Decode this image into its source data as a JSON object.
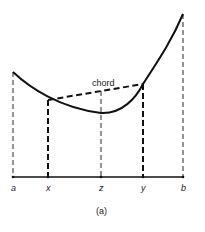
{
  "diagram": {
    "caption": "(a)",
    "chord_label": "chord",
    "axis_labels": {
      "a": "a",
      "x": "x",
      "z": "z",
      "y": "y",
      "b": "b"
    },
    "colors": {
      "stroke": "#111111",
      "background": "#ffffff"
    }
  }
}
